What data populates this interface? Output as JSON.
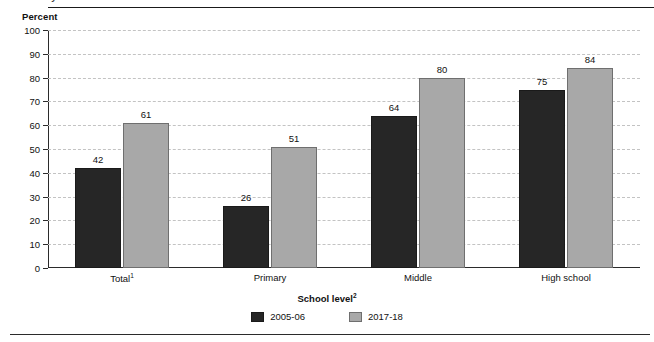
{
  "figure": {
    "clipped_title": "years 2005-06 and 2017-18",
    "unit_label": "Percent"
  },
  "chart_data": {
    "type": "bar",
    "title": "",
    "xlabel": "School level",
    "xlabel_superscript": "2",
    "ylabel": "Percent",
    "ylim": [
      0,
      100
    ],
    "yticks": [
      0,
      10,
      20,
      30,
      40,
      50,
      60,
      70,
      80,
      90,
      100
    ],
    "ytick_labels": [
      "0",
      "10",
      "20",
      "30",
      "40",
      "50",
      "60",
      "70",
      "80",
      "90",
      "100"
    ],
    "grid": "horizontal-dashed",
    "legend_position": "bottom-center",
    "categories": [
      "Total",
      "Primary",
      "Middle",
      "High school"
    ],
    "category_superscripts": [
      "1",
      "",
      "",
      ""
    ],
    "series": [
      {
        "name": "2005-06",
        "color": "#262626",
        "values": [
          42,
          26,
          64,
          75
        ]
      },
      {
        "name": "2017-18",
        "color": "#a8a8a8",
        "values": [
          61,
          51,
          80,
          84
        ]
      }
    ]
  },
  "legend": {
    "items": [
      {
        "label": "2005-06",
        "series": 0
      },
      {
        "label": "2017-18",
        "series": 1
      }
    ]
  }
}
